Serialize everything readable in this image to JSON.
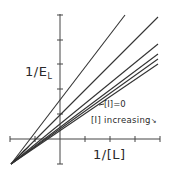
{
  "diagram": {
    "type": "double-reciprocal (Lineweaver-Burk style) plot",
    "y_axis_label": "1/E",
    "y_axis_label_subscript": "L",
    "x_axis_label": "1/[L]",
    "annotations": {
      "baseline_label": "[I]=0",
      "trend_label": "[I] increasing",
      "trend_arrow": "↘"
    },
    "colors": {
      "line": "#333333",
      "axis": "#444444",
      "background": "#ffffff"
    },
    "series_count": 6
  }
}
